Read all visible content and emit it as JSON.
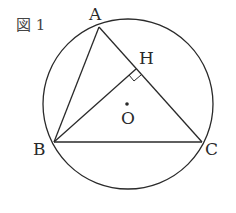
{
  "figure": {
    "caption": "図 1",
    "stroke_color": "#2a2a2a",
    "background": "#ffffff"
  },
  "points": {
    "A": {
      "label": "A",
      "x": 99,
      "y": 27
    },
    "B": {
      "label": "B",
      "x": 54,
      "y": 142
    },
    "C": {
      "label": "C",
      "x": 202,
      "y": 142
    },
    "H": {
      "label": "H",
      "x": 135,
      "y": 70
    },
    "O": {
      "label": "O",
      "x": 127,
      "y": 104
    }
  },
  "circle": {
    "cx": 128,
    "cy": 104,
    "r": 85
  },
  "segments": [
    "AB",
    "AC",
    "BC",
    "BH"
  ],
  "annotations": {
    "right_angle_at": "H"
  }
}
